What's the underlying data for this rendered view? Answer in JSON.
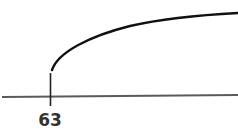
{
  "diagram": {
    "type": "number-line-with-curve",
    "axis": {
      "color": "#5a5a5a"
    },
    "tick": {
      "label": "63",
      "color": "#222222"
    },
    "curve": {
      "description": "square-root-like curve starting just above the tick at 63 and rising to the right",
      "color": "#111111"
    }
  }
}
